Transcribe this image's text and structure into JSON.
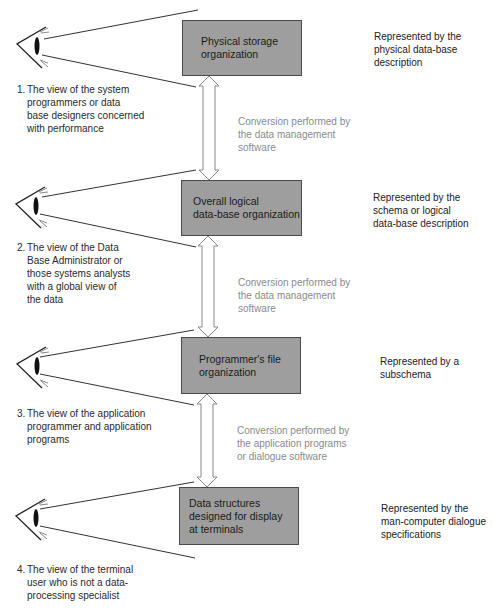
{
  "levels": [
    {
      "box": [
        "Physical storage",
        "organization"
      ],
      "represented": [
        "Represented by the",
        "physical data-base",
        "description"
      ],
      "view_number": "1.",
      "view": [
        "The view of the system",
        "programmers or data",
        "base designers concerned",
        "with performance"
      ]
    },
    {
      "box": [
        "Overall logical",
        "data-base organization"
      ],
      "represented": [
        "Represented by the",
        "schema or logical",
        "data-base description"
      ],
      "view_number": "2.",
      "view": [
        "The view of the Data",
        "Base Administrator or",
        "those systems analysts",
        "with a global view of",
        "the data"
      ]
    },
    {
      "box": [
        "Programmer's file",
        "organization"
      ],
      "represented": [
        "Represented by a",
        "subschema"
      ],
      "view_number": "3.",
      "view": [
        "The view of the application",
        "programmer and application",
        "programs"
      ]
    },
    {
      "box": [
        "Data structures",
        "designed for display",
        "at terminals"
      ],
      "represented": [
        "Represented by the",
        "man-computer dialogue",
        "specifications"
      ],
      "view_number": "4.",
      "view": [
        "The view of the terminal",
        "user who is not a data-",
        "processing specialist"
      ]
    }
  ],
  "conversions": [
    [
      "Conversion performed by",
      "the data management",
      "software"
    ],
    [
      "Conversion performed by",
      "the data management",
      "software"
    ],
    [
      "Conversion performed by",
      "the application programs",
      "or dialogue software"
    ]
  ],
  "icons": [
    "eye-icon",
    "double-arrow-icon"
  ],
  "colors": {
    "box_fill": "#9e9e9e",
    "box_border": "#4a4a4a",
    "conversion_text": "#8a8a8a",
    "line": "#333333"
  }
}
